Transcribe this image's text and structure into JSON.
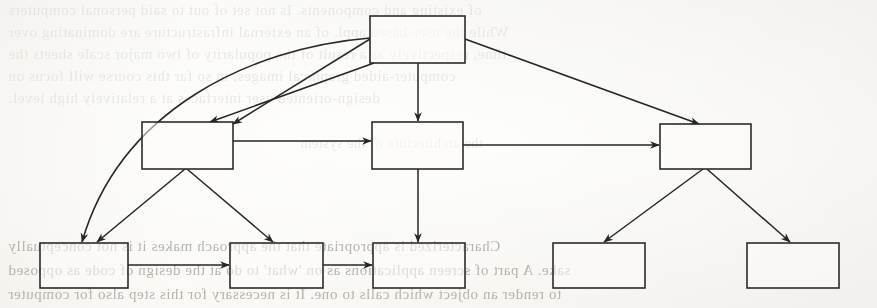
{
  "page": {
    "width": 877,
    "height": 308,
    "background_color": "#f7f6f3",
    "ink_color": "#262626",
    "ghost_text_color": "#b9b5ad"
  },
  "ghost_text": {
    "note": "Mirrored show-through text from the reverse of the scanned page; rendered flipped and very low contrast.",
    "lines": [
      {
        "id": "g1",
        "text": "of existing and components. Is not set of out to said personal computers",
        "x": 8,
        "y": 2,
        "size": 15,
        "weight": "faint"
      },
      {
        "id": "g2",
        "text": "While the user-based appl. of an external infrastructure are dominating over",
        "x": 8,
        "y": 24,
        "size": 15,
        "weight": "faint"
      },
      {
        "id": "g3",
        "text": "time, respectively as a result of the popularity of two major scale sheets the",
        "x": 8,
        "y": 46,
        "size": 15,
        "weight": "faint"
      },
      {
        "id": "g4",
        "text": "computer-aided graphical images, in so far this course will focus on",
        "x": 8,
        "y": 68,
        "size": 15,
        "weight": "faint"
      },
      {
        "id": "g5",
        "text": "design-oriented user interfaces at a relatively high level.",
        "x": 8,
        "y": 90,
        "size": 15,
        "weight": "faint"
      },
      {
        "id": "g6",
        "text": "the architecture of the system",
        "x": 300,
        "y": 136,
        "size": 14,
        "weight": "faint"
      },
      {
        "id": "g7",
        "text": "Characterized is appropriate that the approach makes it is not conceptually",
        "x": 8,
        "y": 238,
        "size": 15,
        "weight": "strong"
      },
      {
        "id": "g8",
        "text": "sake. A part of screen applications as on  'what' to do at the design of code as opposed",
        "x": 8,
        "y": 262,
        "size": 15,
        "weight": "strong"
      },
      {
        "id": "g9",
        "text": "to render an object which calls to one.   It is necessary for  this step also for computer",
        "x": 8,
        "y": 286,
        "size": 15,
        "weight": "strong"
      }
    ]
  },
  "diagram": {
    "type": "block-hierarchy",
    "node_count": 9,
    "edge_count": 12,
    "nodes": [
      {
        "id": "n-root",
        "label": "",
        "level": 0,
        "x": 370,
        "y": 16,
        "w": 95,
        "h": 47
      },
      {
        "id": "n-mid-left",
        "label": "",
        "level": 1,
        "x": 142,
        "y": 122,
        "w": 91,
        "h": 47
      },
      {
        "id": "n-mid-center",
        "label": "",
        "level": 1,
        "x": 372,
        "y": 122,
        "w": 91,
        "h": 47
      },
      {
        "id": "n-mid-right",
        "label": "",
        "level": 1,
        "x": 660,
        "y": 124,
        "w": 91,
        "h": 45
      },
      {
        "id": "n-bottom-1",
        "label": "",
        "level": 2,
        "x": 40,
        "y": 243,
        "w": 88,
        "h": 45
      },
      {
        "id": "n-bottom-2",
        "label": "",
        "level": 2,
        "x": 230,
        "y": 243,
        "w": 93,
        "h": 45
      },
      {
        "id": "n-bottom-3",
        "label": "",
        "level": 2,
        "x": 373,
        "y": 243,
        "w": 92,
        "h": 45
      },
      {
        "id": "n-bottom-4",
        "label": "",
        "level": 2,
        "x": 553,
        "y": 243,
        "w": 92,
        "h": 45
      },
      {
        "id": "n-bottom-5",
        "label": "",
        "level": 2,
        "x": 747,
        "y": 243,
        "w": 92,
        "h": 45
      }
    ],
    "edges": [
      {
        "id": "e1",
        "from": "n-root",
        "to": "n-mid-left",
        "style": "straight",
        "arrow": true,
        "d": "M 370 39 L 233 124"
      },
      {
        "id": "e2",
        "from": "n-root",
        "to": "n-mid-left",
        "style": "straight",
        "arrow": true,
        "d": "M 374 63 L 210 122"
      },
      {
        "id": "e3",
        "from": "n-root",
        "to": "n-bottom-1",
        "style": "curved",
        "arrow": true,
        "d": "M 370 38 C 250 48, 120 110, 82 242"
      },
      {
        "id": "e4",
        "from": "n-root",
        "to": "n-mid-center",
        "style": "straight",
        "arrow": true,
        "d": "M 418 63 L 418 121"
      },
      {
        "id": "e5",
        "from": "n-root",
        "to": "n-mid-right",
        "style": "straight",
        "arrow": true,
        "d": "M 465 39 L 699 124"
      },
      {
        "id": "e6",
        "from": "n-mid-left",
        "to": "n-mid-center",
        "style": "straight",
        "arrow": true,
        "d": "M 233 141 L 371 141"
      },
      {
        "id": "e7",
        "from": "n-mid-center",
        "to": "n-mid-right",
        "style": "straight",
        "arrow": true,
        "d": "M 463 145 L 659 145"
      },
      {
        "id": "e8",
        "from": "n-mid-left",
        "to": "n-bottom-1",
        "style": "straight",
        "arrow": true,
        "d": "M 185 169 L 97 242"
      },
      {
        "id": "e9",
        "from": "n-mid-left",
        "to": "n-bottom-2",
        "style": "straight",
        "arrow": true,
        "d": "M 187 169 L 273 242"
      },
      {
        "id": "e10",
        "from": "n-mid-center",
        "to": "n-bottom-3",
        "style": "straight",
        "arrow": true,
        "d": "M 418 169 L 418 242"
      },
      {
        "id": "e11",
        "from": "n-mid-right",
        "to": "n-bottom-4",
        "style": "straight",
        "arrow": true,
        "d": "M 703 169 L 604 242"
      },
      {
        "id": "e12",
        "from": "n-mid-right",
        "to": "n-bottom-5",
        "style": "straight",
        "arrow": true,
        "d": "M 707 169 L 790 242"
      },
      {
        "id": "e13",
        "from": "n-bottom-1",
        "to": "n-bottom-2",
        "style": "straight",
        "arrow": true,
        "d": "M 128 265 L 229 265"
      },
      {
        "id": "e14",
        "from": "n-bottom-2",
        "to": "n-bottom-3",
        "style": "straight",
        "arrow": true,
        "d": "M 323 265 L 372 265"
      }
    ]
  }
}
